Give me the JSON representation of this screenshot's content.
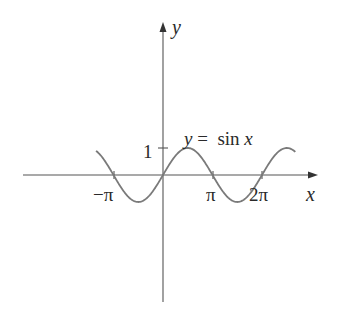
{
  "chart_data": {
    "type": "line",
    "title": "",
    "function": "y = sin x",
    "xlabel": "x",
    "ylabel": "y",
    "x_tick_labels": [
      "−π",
      "π",
      "2π"
    ],
    "x_tick_values": [
      -3.14159,
      3.14159,
      6.28319
    ],
    "y_tick_labels": [
      "1"
    ],
    "y_tick_values": [
      1
    ],
    "xlim": [
      -3.3,
      5.15
    ],
    "ylim": [
      -4.8,
      5.7
    ],
    "curve_domain": [
      -3.9,
      4.6
    ],
    "series": [
      {
        "name": "y = sin x",
        "x": [
          -3.9,
          -3.14159,
          -2.35619,
          -1.5708,
          -0.7854,
          0,
          0.7854,
          1.5708,
          2.35619,
          3.14159,
          3.92699,
          4.71239,
          5.49779,
          6.28319,
          7.06858,
          7.85398,
          8.0
        ],
        "values": [
          0.688,
          0,
          -0.707,
          -1,
          -0.707,
          0,
          0.707,
          1,
          0.707,
          0,
          -0.707,
          -1,
          -0.707,
          0,
          0.707,
          1,
          0.989
        ]
      }
    ],
    "grid": false,
    "legend": "none",
    "annotation": "y = sin x"
  },
  "labels": {
    "x_axis": "x",
    "y_axis": "y",
    "one": "1",
    "neg_pi": "−π",
    "pi": "π",
    "two_pi": "2π",
    "eq_y": "y",
    "eq_rest": " =  sin ",
    "eq_x": "x"
  }
}
